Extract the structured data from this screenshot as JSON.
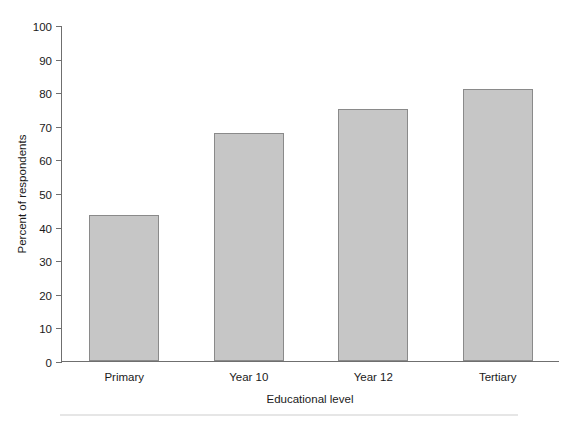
{
  "chart_data": {
    "type": "bar",
    "title": "",
    "xlabel": "Educational level",
    "ylabel": "Percent of respondents",
    "categories": [
      "Primary",
      "Year 10",
      "Year 12",
      "Tertiary"
    ],
    "values": [
      43.5,
      68,
      75,
      81
    ],
    "ylim": [
      0,
      100
    ],
    "ytick_labels": [
      "0",
      "10",
      "20",
      "30",
      "40",
      "50",
      "60",
      "70",
      "80",
      "90",
      "100"
    ],
    "ytick_values": [
      0,
      10,
      20,
      30,
      40,
      50,
      60,
      70,
      80,
      90,
      100
    ],
    "grid": false,
    "legend": "none",
    "bar_color": "#c6c6c6",
    "bar_edge_color": "#8a8a8a",
    "axis_color": "#6f6f6f",
    "background": "#ffffff"
  }
}
